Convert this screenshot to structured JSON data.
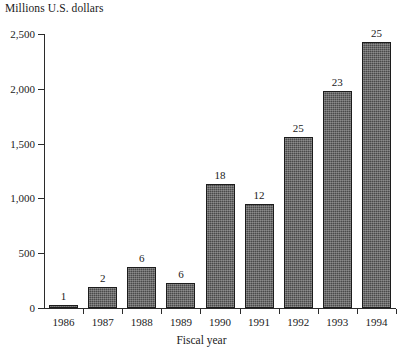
{
  "chart_data": {
    "type": "bar",
    "title": "Millions U.S. dollars",
    "xlabel": "Fiscal year",
    "ylabel": "Millions U.S. dollars",
    "categories": [
      "1986",
      "1987",
      "1988",
      "1989",
      "1990",
      "1991",
      "1992",
      "1993",
      "1994"
    ],
    "values": [
      20,
      190,
      370,
      230,
      1130,
      950,
      1560,
      1980,
      2430
    ],
    "point_labels": [
      "1",
      "2",
      "6",
      "6",
      "18",
      "12",
      "25",
      "23",
      "25"
    ],
    "ylim": [
      0,
      2500
    ],
    "ytick_values": [
      0,
      500,
      1000,
      1500,
      2000,
      2500
    ],
    "ytick_labels": [
      "0",
      "500",
      "1,000",
      "1,500",
      "2,000",
      "2,500"
    ],
    "grid": false,
    "legend": false,
    "bar_color": "#4a4a4a",
    "bar_edge_color": "#1c1c1c",
    "axis_color": "#2b2b2b"
  }
}
